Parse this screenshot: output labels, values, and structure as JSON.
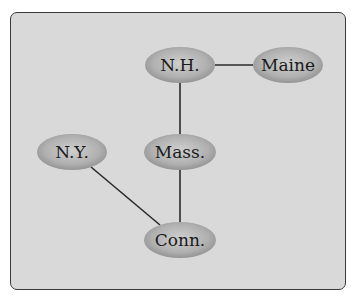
{
  "diagram": {
    "type": "graph",
    "background_color": "#d9d9d9",
    "node_color": "#a8a8a8",
    "nodes": [
      {
        "id": "nh",
        "label": "N.H.",
        "cx": 180,
        "cy": 65
      },
      {
        "id": "maine",
        "label": "Maine",
        "cx": 288,
        "cy": 65
      },
      {
        "id": "ny",
        "label": "N.Y.",
        "cx": 72,
        "cy": 152
      },
      {
        "id": "mass",
        "label": "Mass.",
        "cx": 180,
        "cy": 152
      },
      {
        "id": "conn",
        "label": "Conn.",
        "cx": 180,
        "cy": 240
      }
    ],
    "edges": [
      {
        "from": "N.H.",
        "to": "Maine"
      },
      {
        "from": "N.H.",
        "to": "Mass."
      },
      {
        "from": "Mass.",
        "to": "Conn."
      },
      {
        "from": "N.Y.",
        "to": "Conn."
      }
    ]
  }
}
